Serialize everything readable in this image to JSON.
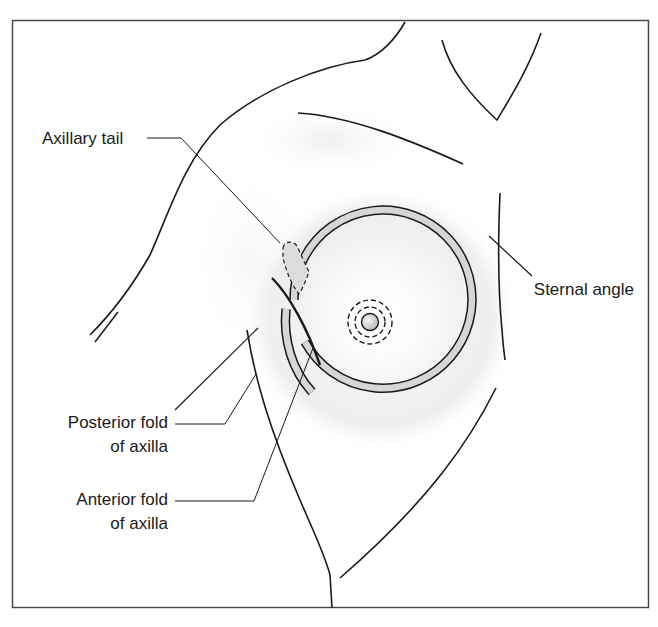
{
  "figure": {
    "type": "anatomical-line-diagram",
    "colors": {
      "line": "#1a1a1a",
      "frame": "#4a4a4a",
      "areola_fill": "#d6d6d6",
      "shadow": "#e6e6e6",
      "background": "#ffffff"
    },
    "labels": {
      "axillary_tail": "Axillary tail",
      "sternal_angle": "Sternal angle",
      "posterior_fold_line1": "Posterior fold",
      "posterior_fold_line2": "of axilla",
      "anterior_fold_line1": "Anterior fold",
      "anterior_fold_line2": "of axilla"
    }
  }
}
